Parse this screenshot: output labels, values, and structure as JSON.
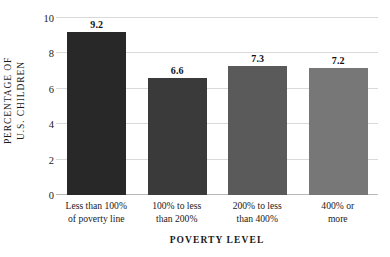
{
  "chart_data": {
    "type": "bar",
    "title": "",
    "xlabel": "POVERTY LEVEL",
    "ylabel_lines": [
      "PERCENTAGE OF",
      "U.S. CHILDREN"
    ],
    "ylabel": "PERCENTAGE OF U.S. CHILDREN",
    "categories": [
      "Less than 100% of poverty line",
      "100% to less than 200%",
      "200% to less than 400%",
      "400% or more"
    ],
    "category_lines": [
      [
        "Less than 100%",
        "of poverty line"
      ],
      [
        "100% to less",
        "than 200%"
      ],
      [
        "200% to less",
        "than 400%"
      ],
      [
        "400% or",
        "more"
      ]
    ],
    "values": [
      9.2,
      6.6,
      7.3,
      7.2
    ],
    "value_labels": [
      "9.2",
      "6.6",
      "7.3",
      "7.2"
    ],
    "bar_colors": [
      "#282828",
      "#3a3a3a",
      "#5a5a5a",
      "#777777"
    ],
    "ylim": [
      0,
      10
    ],
    "yticks": [
      0,
      2,
      4,
      6,
      8,
      10
    ],
    "ytick_labels": [
      "0",
      "2",
      "4",
      "6",
      "8",
      "10"
    ],
    "grid": true,
    "grid_color": "#d9d9d9",
    "legend": "none",
    "background": "#ffffff"
  }
}
